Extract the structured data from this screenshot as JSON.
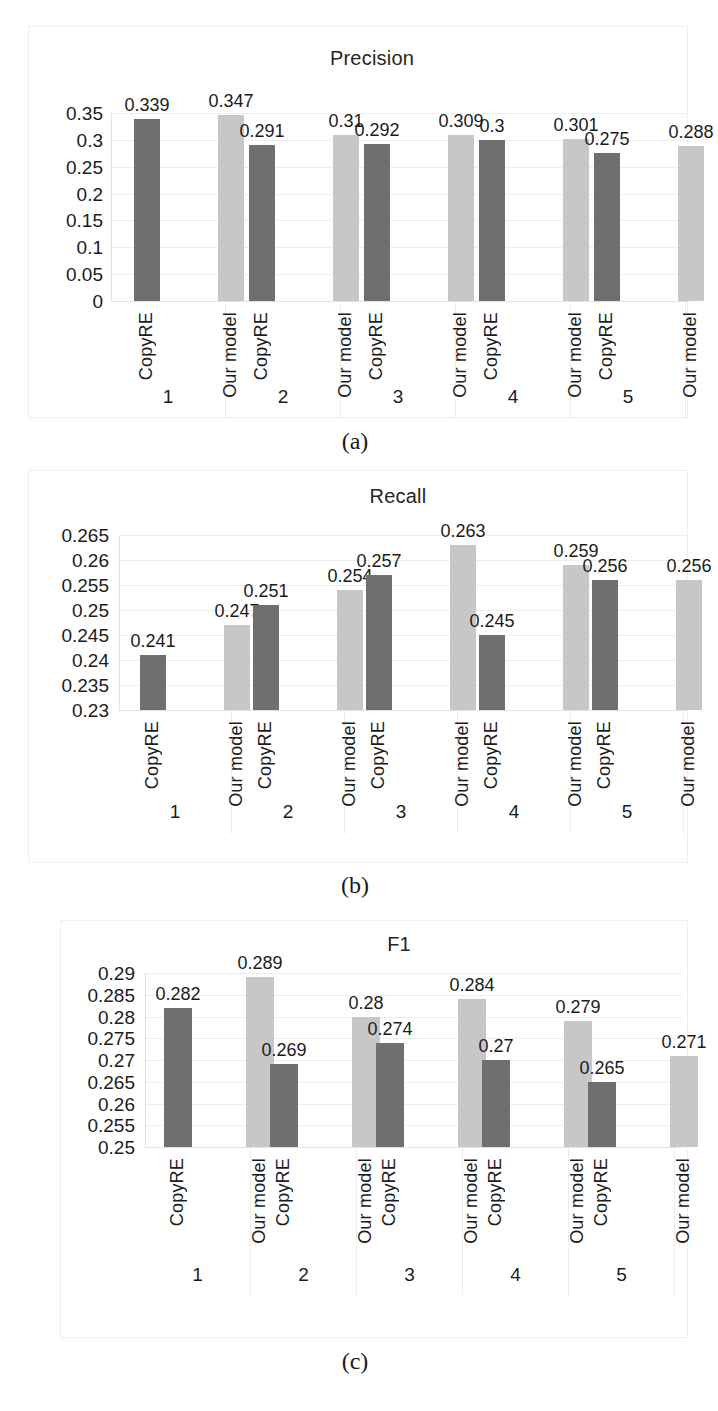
{
  "figure": {
    "bar_colors": {
      "copyre": "#6f6f6f",
      "our_model": "#c7c7c7"
    },
    "captions": {
      "a": "(a)",
      "b": "(b)",
      "c": "(c)"
    }
  },
  "chart_data": [
    {
      "type": "bar",
      "panel": "a",
      "title": "Precision",
      "xlabel": "",
      "ylabel": "",
      "ylim": [
        0,
        0.35
      ],
      "grid": true,
      "legend": "none",
      "categories": [
        "1",
        "2",
        "3",
        "4",
        "5"
      ],
      "series_labels": [
        "CopyRE",
        "Our model"
      ],
      "yticks": [
        "0.35",
        "0.3",
        "0.25",
        "0.2",
        "0.15",
        "0.1",
        "0.05",
        "0"
      ],
      "ytick_values": [
        0.35,
        0.3,
        0.25,
        0.2,
        0.15,
        0.1,
        0.05,
        0
      ],
      "series": [
        {
          "name": "CopyRE",
          "values": [
            0.339,
            0.291,
            0.292,
            0.3,
            0.275
          ],
          "labels": [
            "0.339",
            "0.291",
            "0.292",
            "0.3",
            "0.275"
          ]
        },
        {
          "name": "Our model",
          "values": [
            0.347,
            0.31,
            0.309,
            0.301,
            0.288
          ],
          "labels": [
            "0.347",
            "0.31",
            "0.309",
            "0.301",
            "0.288"
          ]
        }
      ]
    },
    {
      "type": "bar",
      "panel": "b",
      "title": "Recall",
      "xlabel": "",
      "ylabel": "",
      "ylim": [
        0.23,
        0.265
      ],
      "grid": true,
      "legend": "none",
      "categories": [
        "1",
        "2",
        "3",
        "4",
        "5"
      ],
      "series_labels": [
        "CopyRE",
        "Our model"
      ],
      "yticks": [
        "0.265",
        "0.26",
        "0.255",
        "0.25",
        "0.245",
        "0.24",
        "0.235",
        "0.23"
      ],
      "ytick_values": [
        0.265,
        0.26,
        0.255,
        0.25,
        0.245,
        0.24,
        0.235,
        0.23
      ],
      "series": [
        {
          "name": "CopyRE",
          "values": [
            0.241,
            0.251,
            0.257,
            0.245,
            0.256
          ],
          "labels": [
            "0.241",
            "0.251",
            "0.257",
            "0.245",
            "0.256"
          ]
        },
        {
          "name": "Our model",
          "values": [
            0.247,
            0.254,
            0.263,
            0.259,
            0.256
          ],
          "labels": [
            "0.247",
            "0.254",
            "0.263",
            "0.259",
            "0.256"
          ]
        }
      ]
    },
    {
      "type": "bar",
      "panel": "c",
      "title": "F1",
      "xlabel": "",
      "ylabel": "",
      "ylim": [
        0.25,
        0.29
      ],
      "grid": true,
      "legend": "none",
      "categories": [
        "1",
        "2",
        "3",
        "4",
        "5"
      ],
      "series_labels": [
        "CopyRE",
        "Our model"
      ],
      "yticks": [
        "0.29",
        "0.285",
        "0.28",
        "0.275",
        "0.27",
        "0.265",
        "0.26",
        "0.255",
        "0.25"
      ],
      "ytick_values": [
        0.29,
        0.285,
        0.28,
        0.275,
        0.27,
        0.265,
        0.26,
        0.255,
        0.25
      ],
      "series": [
        {
          "name": "CopyRE",
          "values": [
            0.282,
            0.269,
            0.274,
            0.27,
            0.265
          ],
          "labels": [
            "0.282",
            "0.269",
            "0.274",
            "0.27",
            "0.265"
          ]
        },
        {
          "name": "Our model",
          "values": [
            0.289,
            0.28,
            0.284,
            0.279,
            0.271
          ],
          "labels": [
            "0.289",
            "0.28",
            "0.284",
            "0.279",
            "0.271"
          ]
        }
      ]
    }
  ]
}
